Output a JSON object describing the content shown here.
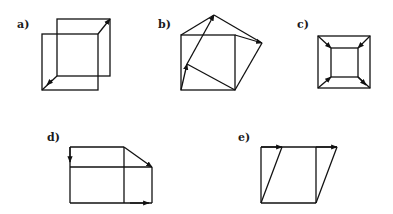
{
  "figures": [
    {
      "id": "a",
      "label": "a)"
    },
    {
      "id": "b",
      "label": "b)"
    },
    {
      "id": "c",
      "label": "c)"
    },
    {
      "id": "d",
      "label": "d)"
    },
    {
      "id": "e",
      "label": "e)"
    }
  ],
  "colors": {
    "line": "#111111",
    "background": "#ffffff"
  }
}
